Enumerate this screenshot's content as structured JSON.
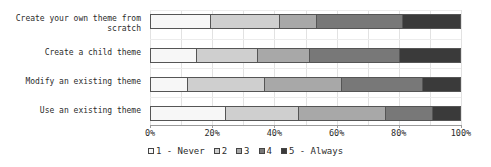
{
  "chart_data": {
    "type": "bar",
    "orientation": "horizontal",
    "stacked": true,
    "normalized_percent": true,
    "title": "",
    "xlabel": "",
    "ylabel": "",
    "xlim": [
      0,
      100
    ],
    "grid": true,
    "legend_position": "bottom",
    "categories": [
      "Create your own theme from scratch",
      "Create a child theme",
      "Modify an existing theme",
      "Use an existing theme"
    ],
    "xticks": [
      0,
      20,
      40,
      60,
      80,
      100
    ],
    "xtick_labels": [
      "0%",
      "20%",
      "40%",
      "60%",
      "80%",
      "100%"
    ],
    "series": [
      {
        "name": "1 - Never",
        "color": "#f7f7f7",
        "values": [
          19.3,
          14.8,
          11.9,
          24.4
        ]
      },
      {
        "name": "2",
        "color": "#cfcfcf",
        "values": [
          22.2,
          19.6,
          24.8,
          23.5
        ]
      },
      {
        "name": "3",
        "color": "#a8a8a8",
        "values": [
          11.9,
          16.7,
          25.0,
          28.0
        ]
      },
      {
        "name": "4",
        "color": "#787878",
        "values": [
          28.0,
          29.3,
          26.1,
          15.4
        ]
      },
      {
        "name": "5 - Always",
        "color": "#3a3a3a",
        "values": [
          18.6,
          19.6,
          12.2,
          8.7
        ]
      }
    ],
    "legend_entries": [
      {
        "label": "1 - Never",
        "color": "#f7f7f7"
      },
      {
        "label": "2",
        "color": "#cfcfcf"
      },
      {
        "label": "3",
        "color": "#a8a8a8"
      },
      {
        "label": "4",
        "color": "#787878"
      },
      {
        "label": "5 - Always",
        "color": "#3a3a3a"
      }
    ]
  }
}
